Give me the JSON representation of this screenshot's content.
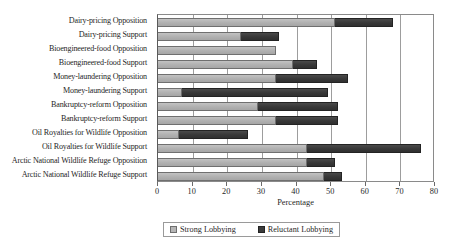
{
  "chart_data": {
    "type": "bar",
    "orientation": "horizontal",
    "stacked": true,
    "title": "",
    "xlabel": "Percentage",
    "ylabel": "",
    "xlim": [
      0,
      80
    ],
    "xticks": [
      0,
      10,
      20,
      30,
      40,
      50,
      60,
      70,
      80
    ],
    "grid": true,
    "grid_axis": "x",
    "legend_position": "bottom",
    "categories": [
      "Dairy-pricing Opposition",
      "Dairy-pricing Support",
      "Bioengineered-food Opposition",
      "Bioengineered-food Support",
      "Money-laundering Opposition",
      "Money-laundering Support",
      "Bankruptcy-reform Opposition",
      "Bankruptcy-reform Support",
      "Oil Royalties for Wildlife Opposition",
      "Oil Royalties for Wildlife Support",
      "Arctic National Wildlife Refuge Opposition",
      "Arctic National Wildlife Refuge Support"
    ],
    "series": [
      {
        "name": "Strong Lobbying",
        "color": "#b3b3b3",
        "values": [
          51,
          24,
          34,
          39,
          34,
          7,
          29,
          34,
          6,
          43,
          43,
          48
        ]
      },
      {
        "name": "Reluctant Lobbying",
        "color": "#3d3d3d",
        "values": [
          17,
          11,
          0,
          7,
          21,
          42,
          23,
          18,
          20,
          33,
          8,
          5
        ]
      }
    ],
    "totals": [
      68,
      35,
      34,
      46,
      55,
      49,
      52,
      52,
      26,
      76,
      51,
      53
    ]
  },
  "legend": {
    "items": [
      {
        "label": "Strong Lobbying",
        "swatch": "strong-lobbying-swatch"
      },
      {
        "label": "Reluctant Lobbying",
        "swatch": "reluctant-lobbying-swatch"
      }
    ]
  },
  "axis": {
    "x_title": "Percentage",
    "x_tick_labels": [
      "0",
      "10",
      "20",
      "30",
      "40",
      "50",
      "60",
      "70",
      "80"
    ]
  }
}
